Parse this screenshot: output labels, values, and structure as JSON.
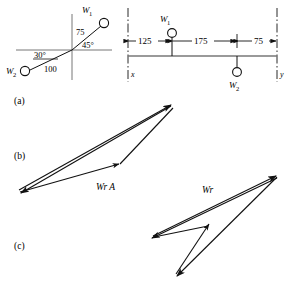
{
  "figure": {
    "panels": [
      {
        "id": "a",
        "label": "(a)"
      },
      {
        "id": "b",
        "label": "(b)"
      },
      {
        "id": "c",
        "label": "(c)"
      }
    ],
    "polar_diagram": {
      "mass_1": {
        "label": "W",
        "subscript": "1",
        "magnitude": "75",
        "angle": "45°"
      },
      "mass_2": {
        "label": "W",
        "subscript": "2",
        "magnitude": "100",
        "angle": "30°"
      }
    },
    "shaft_diagram": {
      "bearing_left": "x",
      "bearing_right": "y",
      "dimensions": [
        "125",
        "175",
        "75"
      ],
      "mass_1": {
        "label": "W",
        "subscript": "1"
      },
      "mass_2": {
        "label": "W",
        "subscript": "2"
      }
    },
    "vector_polygon_b": {
      "label": "Wr A"
    },
    "vector_polygon_c": {
      "label": "Wr"
    }
  },
  "colors": {
    "ink": "#111111",
    "rule": "#777777"
  }
}
